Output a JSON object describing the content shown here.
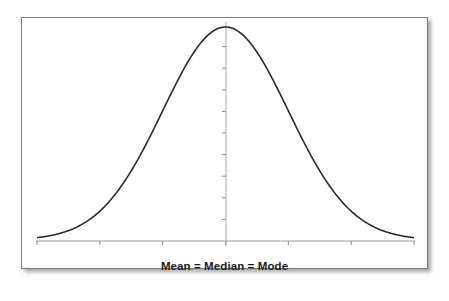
{
  "chart_data": {
    "type": "line",
    "title": "",
    "subtitle": "",
    "xlabel": "Mean = Median = Mode",
    "ylabel": "",
    "distribution": "normal",
    "mean": 0,
    "std_dev": 1,
    "x": [
      -3,
      -2.5,
      -2,
      -1.5,
      -1,
      -0.5,
      0,
      0.5,
      1,
      1.5,
      2,
      2.5,
      3
    ],
    "values": [
      0.0044,
      0.0175,
      0.054,
      0.1295,
      0.242,
      0.352,
      0.3989,
      0.352,
      0.242,
      0.1295,
      0.054,
      0.0175,
      0.0044
    ],
    "x_ticks": [
      -3,
      -2,
      -1,
      0,
      1,
      2,
      3
    ],
    "x_tick_labels": [
      "",
      "",
      "",
      "",
      "",
      "",
      ""
    ],
    "y_ticks_count": 10,
    "y_tick_labels": [],
    "xlim": [
      -3,
      3
    ],
    "ylim": [
      0,
      0.4
    ],
    "grid": false,
    "legend": null,
    "annotations": [
      "Mean = Median = Mode"
    ],
    "colors": {
      "curve": "#2a2a2a",
      "axis": "#9a9a9a",
      "frame": "#7a7a7a",
      "background": "#ffffff"
    }
  },
  "caption": {
    "text": "Mean = Median = Mode"
  }
}
